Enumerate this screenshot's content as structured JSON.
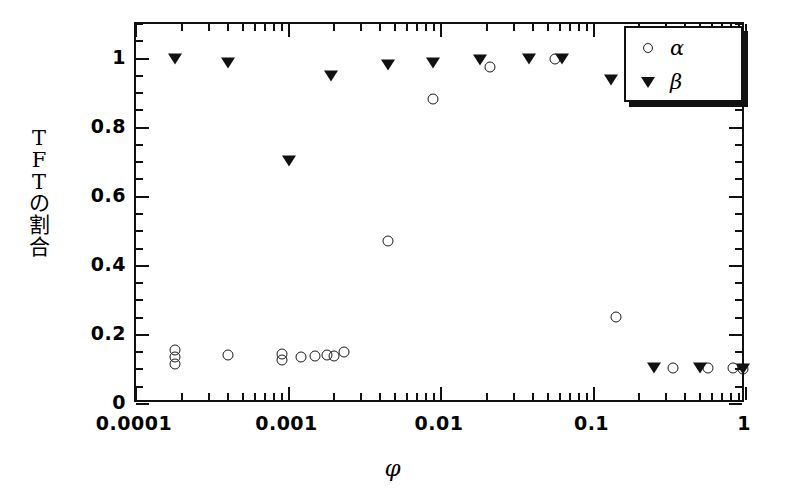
{
  "chart_data": {
    "type": "scatter",
    "title": "",
    "xlabel": "φ",
    "ylabel": "TFTの割合",
    "ylabel_chars": [
      "T",
      "F",
      "T",
      "の",
      "割",
      "合"
    ],
    "xscale": "log",
    "yscale": "linear",
    "xlim": [
      0.0001,
      1
    ],
    "ylim": [
      0,
      1.1
    ],
    "grid": false,
    "legend_position": "top-right",
    "xticklabels": [
      "0.0001",
      "0.001",
      "0.01",
      "0.1",
      "1"
    ],
    "xtickvalues": [
      0.0001,
      0.001,
      0.01,
      0.1,
      1
    ],
    "yticklabels": [
      "0",
      "0.2",
      "0.4",
      "0.6",
      "0.8",
      "1"
    ],
    "ytickvalues": [
      0,
      0.2,
      0.4,
      0.6,
      0.8,
      1
    ],
    "ytick_minor_step": 0.05,
    "series": [
      {
        "name": "α",
        "marker": "open-circle",
        "color": "#1a1a1a",
        "points": [
          {
            "x": 0.00018,
            "y": 0.155
          },
          {
            "x": 0.00018,
            "y": 0.135
          },
          {
            "x": 0.00018,
            "y": 0.115
          },
          {
            "x": 0.0004,
            "y": 0.142
          },
          {
            "x": 0.0009,
            "y": 0.145
          },
          {
            "x": 0.0009,
            "y": 0.128
          },
          {
            "x": 0.0012,
            "y": 0.137
          },
          {
            "x": 0.0015,
            "y": 0.14
          },
          {
            "x": 0.0018,
            "y": 0.143
          },
          {
            "x": 0.002,
            "y": 0.14
          },
          {
            "x": 0.0023,
            "y": 0.15
          },
          {
            "x": 0.0045,
            "y": 0.472
          },
          {
            "x": 0.0088,
            "y": 0.884
          },
          {
            "x": 0.021,
            "y": 0.975
          },
          {
            "x": 0.056,
            "y": 1.0
          },
          {
            "x": 0.14,
            "y": 0.252
          },
          {
            "x": 0.33,
            "y": 0.105
          },
          {
            "x": 0.56,
            "y": 0.103
          },
          {
            "x": 0.82,
            "y": 0.103
          },
          {
            "x": 0.95,
            "y": 0.1
          }
        ]
      },
      {
        "name": "β",
        "marker": "filled-down-triangle",
        "color": "#111111",
        "points": [
          {
            "x": 0.00018,
            "y": 0.998
          },
          {
            "x": 0.0004,
            "y": 0.988
          },
          {
            "x": 0.001,
            "y": 0.703
          },
          {
            "x": 0.0019,
            "y": 0.95
          },
          {
            "x": 0.0045,
            "y": 0.982
          },
          {
            "x": 0.0088,
            "y": 0.987
          },
          {
            "x": 0.018,
            "y": 0.997
          },
          {
            "x": 0.038,
            "y": 1.0
          },
          {
            "x": 0.062,
            "y": 1.0
          },
          {
            "x": 0.13,
            "y": 0.938
          },
          {
            "x": 0.25,
            "y": 0.105
          },
          {
            "x": 0.5,
            "y": 0.103
          },
          {
            "x": 0.95,
            "y": 0.1
          }
        ]
      }
    ]
  },
  "legend": {
    "entries": [
      {
        "label": "α",
        "marker": "open-circle"
      },
      {
        "label": "β",
        "marker": "filled-down-triangle"
      }
    ]
  }
}
